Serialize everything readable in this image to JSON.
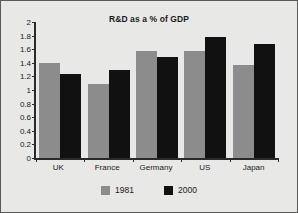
{
  "chart_data": {
    "type": "bar",
    "title": "R&D as a % of GDP",
    "xlabel": "",
    "ylabel": "",
    "categories": [
      "UK",
      "France",
      "Germany",
      "US",
      "Japan"
    ],
    "series": [
      {
        "name": "1981",
        "color": "#8c8c8c",
        "values": [
          1.39,
          1.09,
          1.58,
          1.58,
          1.37
        ]
      },
      {
        "name": "2000",
        "color": "#111111",
        "values": [
          1.24,
          1.29,
          1.48,
          1.78,
          1.67
        ]
      }
    ],
    "ylim": [
      0,
      2
    ],
    "ytick_step": 0.2,
    "ytick_labels": [
      "0",
      "0.2",
      "0.4",
      "0.6",
      "0.8",
      "1",
      "1.2",
      "1.4",
      "1.6",
      "1.8",
      "2"
    ],
    "grid": false,
    "legend_position": "bottom"
  },
  "figure": {
    "background_color": "#e8e8e6",
    "border_color": "#5a5a58"
  }
}
